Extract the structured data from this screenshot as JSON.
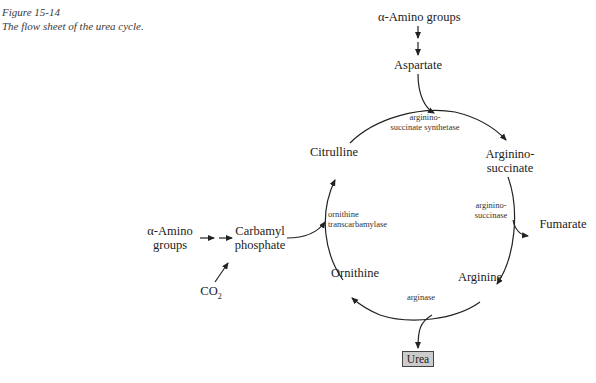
{
  "caption": {
    "figure_number": "Figure 15-14",
    "title": "The flow sheet of the urea cycle."
  },
  "nodes": {
    "amino_groups_top": "α-Amino groups",
    "aspartate": "Aspartate",
    "citrulline": "Citrulline",
    "argininosuccinate_line1": "Arginino-",
    "argininosuccinate_line2": "succinate",
    "fumarate": "Fumarate",
    "arginine": "Arginine",
    "ornithine": "Ornithine",
    "urea": "Urea",
    "amino_groups_left_line1": "α-Amino",
    "amino_groups_left_line2": "groups",
    "carbamyl_line1": "Carbamyl",
    "carbamyl_line2": "phosphate",
    "co2_base": "CO",
    "co2_sub": "2"
  },
  "enzymes": {
    "synthetase_line1": "arginino-",
    "synthetase_line2": "succinate synthetase",
    "succinase_line1": "arginino-",
    "succinase_line2": "succinase",
    "transcarbamylase_line1": "ornithine",
    "transcarbamylase_line2": "transcarbamylase",
    "arginase": "arginase"
  },
  "colors": {
    "line": "#222222",
    "urea_box_fill": "#cccccc",
    "urea_box_border": "#444444"
  }
}
